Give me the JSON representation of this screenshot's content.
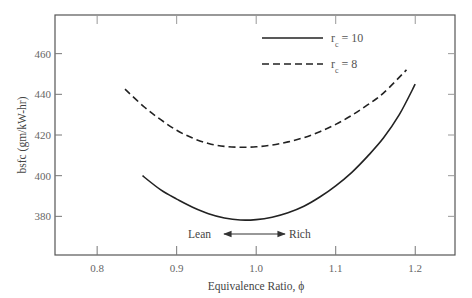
{
  "chart_data": {
    "type": "line",
    "title": "",
    "xlabel": "Equivalence Ratio, ϕ",
    "ylabel": "bsfc (gm/kW-hr)",
    "xlim": [
      0.747,
      1.25
    ],
    "ylim": [
      361,
      479
    ],
    "xticks": [
      0.8,
      0.9,
      1.0,
      1.1,
      1.2
    ],
    "xtick_labels": [
      "0.8",
      "0.9",
      "1.0",
      "1.1",
      "1.2"
    ],
    "yticks": [
      380,
      400,
      420,
      440,
      460
    ],
    "ytick_labels": [
      "380",
      "400",
      "420",
      "440",
      "460"
    ],
    "grid": false,
    "legend_position": "upper right (inside)",
    "series": [
      {
        "name": "r_c = 10",
        "label_main": "r",
        "label_sub": "c",
        "label_rest": " = 10",
        "style": "solid",
        "color": "#222222",
        "x": [
          0.857,
          0.88,
          0.9,
          0.92,
          0.94,
          0.96,
          0.98,
          1.0,
          1.02,
          1.04,
          1.06,
          1.08,
          1.1,
          1.12,
          1.14,
          1.16,
          1.18,
          1.2
        ],
        "y": [
          400,
          393,
          388.5,
          384.5,
          381.3,
          379.2,
          378.2,
          378.4,
          379.6,
          381.8,
          385,
          389.5,
          395,
          401.5,
          409.5,
          418.5,
          430,
          445
        ]
      },
      {
        "name": "r_c = 8",
        "label_main": "r",
        "label_sub": "c",
        "label_rest": " = 8",
        "style": "dashed",
        "color": "#222222",
        "x": [
          0.835,
          0.86,
          0.88,
          0.9,
          0.92,
          0.94,
          0.96,
          0.98,
          1.0,
          1.02,
          1.04,
          1.06,
          1.08,
          1.1,
          1.12,
          1.14,
          1.16,
          1.189
        ],
        "y": [
          442.5,
          433.5,
          427.5,
          422.3,
          418.5,
          415.8,
          414.4,
          414,
          414.2,
          415.1,
          416.6,
          418.7,
          421.6,
          425.2,
          429.6,
          434.8,
          440.6,
          452
        ]
      }
    ],
    "annotations": [
      {
        "text": "Lean",
        "type": "arrow-left",
        "x_from": 0.975,
        "x_to": 0.925,
        "y": 372
      },
      {
        "text": "Rich",
        "type": "arrow-right",
        "x_from": 0.975,
        "x_to": 1.055,
        "y": 372
      }
    ]
  },
  "legend": {
    "items": [
      {
        "style": "solid",
        "main": "r",
        "sub": "c",
        "rest": " = 10"
      },
      {
        "style": "dashed",
        "main": "r",
        "sub": "c",
        "rest": " = 8"
      }
    ]
  },
  "annotation": {
    "lean_label": "Lean",
    "rich_label": "Rich"
  },
  "axes": {
    "x_title": "Equivalence Ratio, ϕ",
    "y_title": "bsfc (gm/kW-hr)"
  }
}
